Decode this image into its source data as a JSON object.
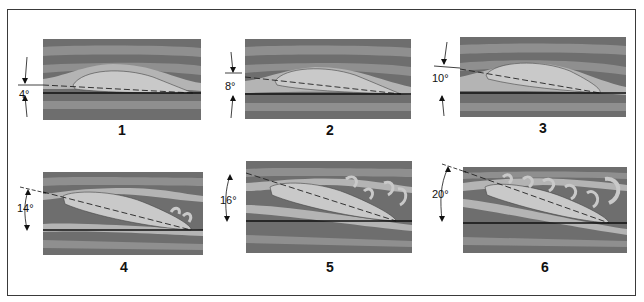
{
  "figure": {
    "panels": [
      {
        "id": "1",
        "label": "1",
        "angle": "4°",
        "angle_deg": 4,
        "flow": "attached"
      },
      {
        "id": "2",
        "label": "2",
        "angle": "8°",
        "angle_deg": 8,
        "flow": "attached"
      },
      {
        "id": "3",
        "label": "3",
        "angle": "10°",
        "angle_deg": 10,
        "flow": "attached"
      },
      {
        "id": "4",
        "label": "4",
        "angle": "14°",
        "angle_deg": 14,
        "flow": "trailing-edge separation"
      },
      {
        "id": "5",
        "label": "5",
        "angle": "16°",
        "angle_deg": 16,
        "flow": "separation with vortices"
      },
      {
        "id": "6",
        "label": "6",
        "angle": "20°",
        "angle_deg": 20,
        "flow": "stalled, full separation"
      }
    ]
  },
  "colors": {
    "dark_stripe": "#6e6e6e",
    "mid_stripe": "#8f8f8f",
    "light_stripe": "#b4b4b4",
    "airfoil": "#c9c9c9",
    "line": "#111111",
    "frame": "#3a3a3a"
  }
}
